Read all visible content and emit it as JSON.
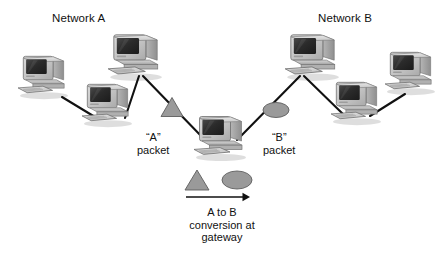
{
  "figure": {
    "type": "network-diagram",
    "background": "#ffffff",
    "ink": "#111111"
  },
  "networks": [
    {
      "id": "a",
      "label": "Network A",
      "label_x": 52,
      "label_y": 12
    },
    {
      "id": "b",
      "label": "Network B",
      "label_x": 318,
      "label_y": 12
    }
  ],
  "hosts": [
    {
      "id": "a1",
      "network": "a",
      "x": 14,
      "y": 52,
      "w": 58,
      "h": 48
    },
    {
      "id": "a2",
      "network": "a",
      "x": 78,
      "y": 80,
      "w": 58,
      "h": 48
    },
    {
      "id": "a3",
      "network": "a",
      "x": 104,
      "y": 30,
      "w": 62,
      "h": 52
    },
    {
      "id": "gw",
      "network": "gateway",
      "x": 190,
      "y": 112,
      "w": 60,
      "h": 50
    },
    {
      "id": "b1",
      "network": "b",
      "x": 281,
      "y": 30,
      "w": 62,
      "h": 52
    },
    {
      "id": "b2",
      "network": "b",
      "x": 327,
      "y": 78,
      "w": 58,
      "h": 48
    },
    {
      "id": "b3",
      "network": "b",
      "x": 381,
      "y": 48,
      "w": 58,
      "h": 48
    }
  ],
  "links": [
    {
      "id": "a1-a2",
      "from": "a1",
      "to": "a2",
      "x1": 62,
      "y1": 97,
      "x2": 95,
      "y2": 117
    },
    {
      "id": "a2-a3",
      "from": "a2",
      "to": "a3",
      "x1": 125,
      "y1": 118,
      "x2": 139,
      "y2": 76
    },
    {
      "id": "a3-gw",
      "from": "a3",
      "to": "gw",
      "x1": 143,
      "y1": 76,
      "x2": 205,
      "y2": 140
    },
    {
      "id": "gw-b1",
      "from": "gw",
      "to": "b1",
      "x1": 237,
      "y1": 140,
      "x2": 300,
      "y2": 76
    },
    {
      "id": "b1-b2",
      "from": "b1",
      "to": "b2",
      "x1": 304,
      "y1": 76,
      "x2": 345,
      "y2": 116
    },
    {
      "id": "b2-b3",
      "from": "b2",
      "to": "b3",
      "x1": 370,
      "y1": 116,
      "x2": 405,
      "y2": 94
    }
  ],
  "packets": [
    {
      "id": "a-packet",
      "shape": "triangle",
      "cx": 172,
      "cy": 107,
      "w": 22,
      "h": 19,
      "fill": "#9a9a9a",
      "stroke": "#5e5e5e",
      "label_line1": "“A”",
      "label_line2": "packet",
      "label_x": 137,
      "label_y": 131
    },
    {
      "id": "b-packet",
      "shape": "ellipse",
      "cx": 276,
      "cy": 110,
      "rx": 13,
      "ry": 7.5,
      "fill": "#9a9a9a",
      "stroke": "#5e5e5e",
      "label_line1": "“B”",
      "label_line2": "packet",
      "label_x": 263,
      "label_y": 131
    }
  ],
  "legend": {
    "triangle": {
      "cx": 197,
      "cy": 180,
      "w": 24,
      "h": 20,
      "fill": "#9a9a9a",
      "stroke": "#5e5e5e"
    },
    "ellipse": {
      "cx": 237,
      "cy": 180,
      "rx": 15,
      "ry": 9,
      "fill": "#9a9a9a",
      "stroke": "#5e5e5e"
    },
    "arrow": {
      "x1": 186,
      "y1": 197,
      "x2": 250,
      "y2": 197,
      "color": "#111111"
    },
    "caption_lines": [
      "A to B",
      "conversion at",
      "gateway"
    ],
    "caption_x": 142,
    "caption_y": 206
  },
  "chart_data": {
    "type": "diagram",
    "title": "A to B conversion at gateway",
    "nodes": [
      {
        "id": "a1",
        "group": "Network A",
        "kind": "desktop-computer"
      },
      {
        "id": "a2",
        "group": "Network A",
        "kind": "desktop-computer"
      },
      {
        "id": "a3",
        "group": "Network A",
        "kind": "desktop-computer"
      },
      {
        "id": "gw",
        "group": "Gateway",
        "kind": "desktop-computer"
      },
      {
        "id": "b1",
        "group": "Network B",
        "kind": "desktop-computer"
      },
      {
        "id": "b2",
        "group": "Network B",
        "kind": "desktop-computer"
      },
      {
        "id": "b3",
        "group": "Network B",
        "kind": "desktop-computer"
      }
    ],
    "edges": [
      [
        "a1",
        "a2"
      ],
      [
        "a2",
        "a3"
      ],
      [
        "a3",
        "gw"
      ],
      [
        "gw",
        "b1"
      ],
      [
        "b1",
        "b2"
      ],
      [
        "b2",
        "b3"
      ]
    ],
    "annotations": [
      {
        "text": "Network A",
        "role": "group-title"
      },
      {
        "text": "Network B",
        "role": "group-title"
      },
      {
        "text": "“A” packet",
        "role": "edge-marker",
        "symbol": "triangle"
      },
      {
        "text": "“B” packet",
        "role": "edge-marker",
        "symbol": "ellipse"
      },
      {
        "text": "A to B conversion at gateway",
        "role": "legend-caption"
      }
    ]
  }
}
